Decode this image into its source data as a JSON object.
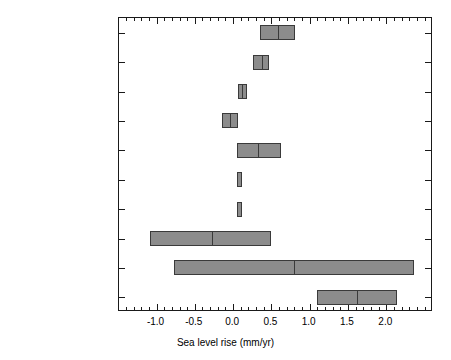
{
  "chart_data": {
    "type": "bar",
    "orientation": "horizontal",
    "title": "",
    "xlabel": "Sea level rise (mm/yr)",
    "ylabel": "",
    "xlim": [
      -1.49,
      2.61
    ],
    "ylim": [
      0,
      10
    ],
    "grid": false,
    "legend": null,
    "xticks": [
      -1.0,
      -0.5,
      0.0,
      0.5,
      1.0,
      1.5,
      2.0
    ],
    "xtick_labels": [
      "-1.0",
      "-0.5",
      "0.0",
      "0.5",
      "1.0",
      "1.5",
      "2.0"
    ],
    "minor_tick_interval": 0.1,
    "bar_style": "range bar with central best-estimate line",
    "categories": [
      "Thermal expansion",
      "Glaciers",
      "Greenland (recent)",
      "Antarctica (recent)",
      "Ice sheets (long-term)",
      "Permafrost",
      "Sediment deposition",
      "Terrestrial storage",
      "Total",
      "Observations"
    ],
    "bars": [
      {
        "category": "Thermal expansion",
        "low": 0.35,
        "high": 0.81,
        "center": 0.59
      },
      {
        "category": "Glaciers",
        "low": 0.26,
        "high": 0.47,
        "center": 0.38
      },
      {
        "category": "Greenland (recent)",
        "low": 0.06,
        "high": 0.18,
        "center": 0.12
      },
      {
        "category": "Antarctica (recent)",
        "low": -0.14,
        "high": 0.06,
        "center": -0.04
      },
      {
        "category": "Ice sheets (long-term)",
        "low": 0.05,
        "high": 0.63,
        "center": 0.33
      },
      {
        "category": "Permafrost",
        "low": 0.05,
        "high": 0.12,
        "center": null
      },
      {
        "category": "Sediment deposition",
        "low": 0.05,
        "high": 0.12,
        "center": null
      },
      {
        "category": "Terrestrial storage",
        "low": -1.08,
        "high": 0.5,
        "center": -0.27
      },
      {
        "category": "Total",
        "low": -0.77,
        "high": 2.36,
        "center": 0.8
      },
      {
        "category": "Observations",
        "low": 1.09,
        "high": 2.14,
        "center": 1.62
      }
    ],
    "colors": {
      "bar_fill": "#8c8c8c",
      "bar_edge": "#3a3a3a",
      "axis": "#1a1a1a",
      "background": "#ffffff",
      "text": "#000000"
    }
  }
}
